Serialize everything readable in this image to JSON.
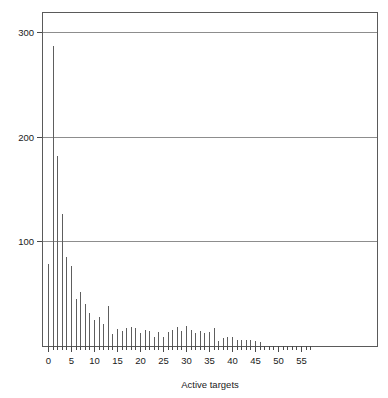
{
  "chart_data": {
    "type": "bar",
    "title": "",
    "subtitle": "",
    "xlabel": "Active targets",
    "ylabel": "",
    "xlim": [
      -1,
      57.5
    ],
    "ylim": [
      0,
      302
    ],
    "grid": "horizontal",
    "legend": "none",
    "x_ticks_major": [
      0,
      5,
      10,
      15,
      20,
      25,
      30,
      35,
      40,
      45,
      50,
      55
    ],
    "x_tick_labels": [
      "0",
      "5",
      "10",
      "15",
      "20",
      "25",
      "30",
      "35",
      "40",
      "45",
      "50",
      "55"
    ],
    "x_ticks_minor_step": 1,
    "y_ticks": [
      100,
      200,
      300
    ],
    "y_tick_labels": [
      "100",
      "200",
      "300"
    ],
    "categories": [
      0,
      1,
      2,
      3,
      4,
      5,
      6,
      7,
      8,
      9,
      10,
      11,
      12,
      13,
      14,
      15,
      16,
      17,
      18,
      19,
      20,
      21,
      22,
      23,
      24,
      25,
      26,
      27,
      28,
      29,
      30,
      31,
      32,
      33,
      34,
      35,
      36,
      37,
      38,
      39,
      40,
      41,
      42,
      43,
      44,
      45,
      46
    ],
    "values": [
      78,
      287,
      182,
      126,
      85,
      76,
      45,
      52,
      40,
      32,
      25,
      28,
      21,
      38,
      11,
      16,
      14,
      17,
      18,
      17,
      12,
      15,
      14,
      9,
      13,
      9,
      13,
      15,
      18,
      14,
      19,
      15,
      12,
      14,
      12,
      13,
      17,
      5,
      8,
      9,
      9,
      6,
      6,
      6,
      6,
      5,
      4
    ],
    "series_name": "count",
    "colors": {
      "bar": "#5e5e5e",
      "grid": "#8d8d8d",
      "frame": "#5a5a5a",
      "text": "#1a1a1a",
      "background": "#ffffff"
    }
  },
  "geometry": {
    "plot_left": 42,
    "plot_right": 378,
    "plot_top": 12,
    "plot_bottom": 346,
    "x_origin_px": 48,
    "px_per_x_unit": 4.6,
    "px_per_y_unit": 1.0466
  }
}
